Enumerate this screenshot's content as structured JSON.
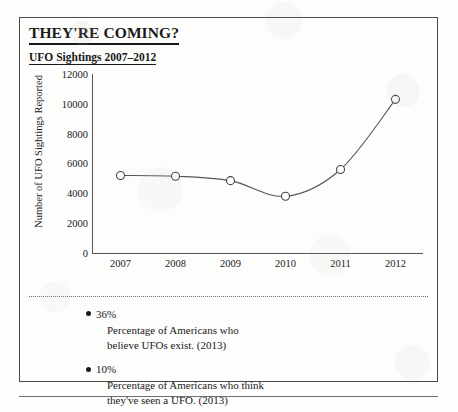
{
  "card": {
    "title": "THEY'RE COMING?",
    "subtitle": "UFO Sightings 2007–2012"
  },
  "notes": [
    {
      "value": "36%",
      "description": "Percentage of Americans who\nbelieve UFOs exist. (2013)"
    },
    {
      "value": "10%",
      "description": "Percentage of Americans who think\nthey've seen a UFO. (2013)"
    }
  ],
  "chart_data": {
    "type": "line",
    "title": "UFO Sightings 2007–2012",
    "xlabel": "",
    "ylabel": "Number of UFO Sightings Reported",
    "categories": [
      "2007",
      "2008",
      "2009",
      "2010",
      "2011",
      "2012"
    ],
    "values": [
      5200,
      5150,
      4850,
      3800,
      5600,
      10300
    ],
    "ylim": [
      0,
      12000
    ],
    "yticks": [
      "0",
      "2000",
      "4000",
      "6000",
      "8000",
      "10000",
      "12000"
    ],
    "ytick_values": [
      0,
      2000,
      4000,
      6000,
      8000,
      10000,
      12000
    ],
    "grid": false,
    "legend": "none",
    "line_color": "#555555",
    "marker_fill": "#ffffff",
    "marker_edge": "#444444"
  }
}
